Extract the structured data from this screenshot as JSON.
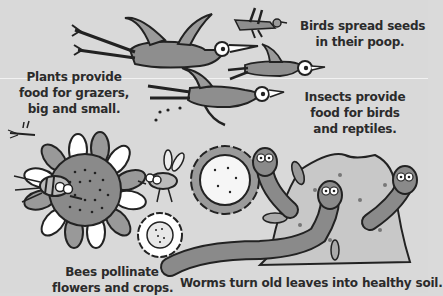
{
  "illustration": {
    "background": "#d9d9d9",
    "text_color": "#2b2b2b",
    "captions": {
      "birds": {
        "lines": [
          "Birds spread seeds",
          "in their poop."
        ]
      },
      "plants": {
        "lines": [
          "Plants provide",
          "food for grazers,",
          "big and small."
        ]
      },
      "insects": {
        "lines": [
          "Insects provide",
          "food for birds",
          "and reptiles."
        ]
      },
      "bees": {
        "lines": [
          "Bees pollinate",
          "flowers and crops."
        ]
      },
      "worms": {
        "lines": [
          "Worms turn old leaves into healthy soil."
        ]
      }
    },
    "figures": [
      "bird-icon",
      "bird-icon",
      "bird-icon",
      "bird-icon",
      "bee-icon",
      "bee-icon",
      "mosquito-icon",
      "flower-icon",
      "flower-icon",
      "flower-icon",
      "worm-icon",
      "worm-icon",
      "worm-icon",
      "soil-mound-icon",
      "leaf-icon"
    ]
  }
}
